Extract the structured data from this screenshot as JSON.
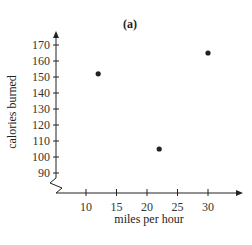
{
  "chart_data": {
    "type": "scatter",
    "title": "(a)",
    "xlabel": "miles per hour",
    "ylabel": "calories burned",
    "x_ticks": [
      10,
      15,
      20,
      25,
      30
    ],
    "y_ticks": [
      90,
      100,
      110,
      120,
      130,
      140,
      150,
      160,
      170
    ],
    "xlim": [
      5,
      35
    ],
    "ylim": [
      80,
      175
    ],
    "axis_break_y": true,
    "grid": false,
    "legend": null,
    "points": [
      {
        "x": 12,
        "y": 152
      },
      {
        "x": 22,
        "y": 105
      },
      {
        "x": 30,
        "y": 165
      }
    ]
  },
  "colors": {
    "axis": "#222222",
    "point": "#222222"
  }
}
